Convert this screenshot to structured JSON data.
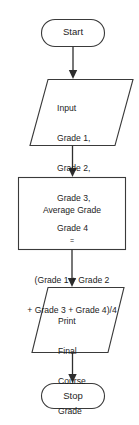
{
  "diagram": {
    "type": "flowchart",
    "background_color": "#ffffff",
    "stroke_color": "#3a3a3a",
    "text_color": "#1d1d1d",
    "nodes": {
      "start": {
        "shape": "terminator",
        "label": "Start"
      },
      "input": {
        "shape": "parallelogram-input",
        "lines": [
          "Input",
          "Grade 1,",
          "Grade 2,",
          "Grade 3,",
          "Grade 4"
        ]
      },
      "process": {
        "shape": "rectangle-process",
        "heading": "Average Grade",
        "equals": "=",
        "formula_lines": [
          "(Grade 1 + Grade 2",
          "+ Grade 3 + Grade 4)/4"
        ]
      },
      "output": {
        "shape": "parallelogram-output",
        "lines": [
          "Print",
          "Final",
          "Course",
          "Grade"
        ]
      },
      "stop": {
        "shape": "terminator",
        "label": "Stop"
      }
    },
    "connectors": [
      {
        "from": "start",
        "to": "input",
        "style": "arrow-down"
      },
      {
        "from": "input",
        "to": "process",
        "style": "arrow-down"
      },
      {
        "from": "process",
        "to": "output",
        "style": "arrow-down"
      },
      {
        "from": "output",
        "to": "stop",
        "style": "arrow-down"
      }
    ]
  }
}
